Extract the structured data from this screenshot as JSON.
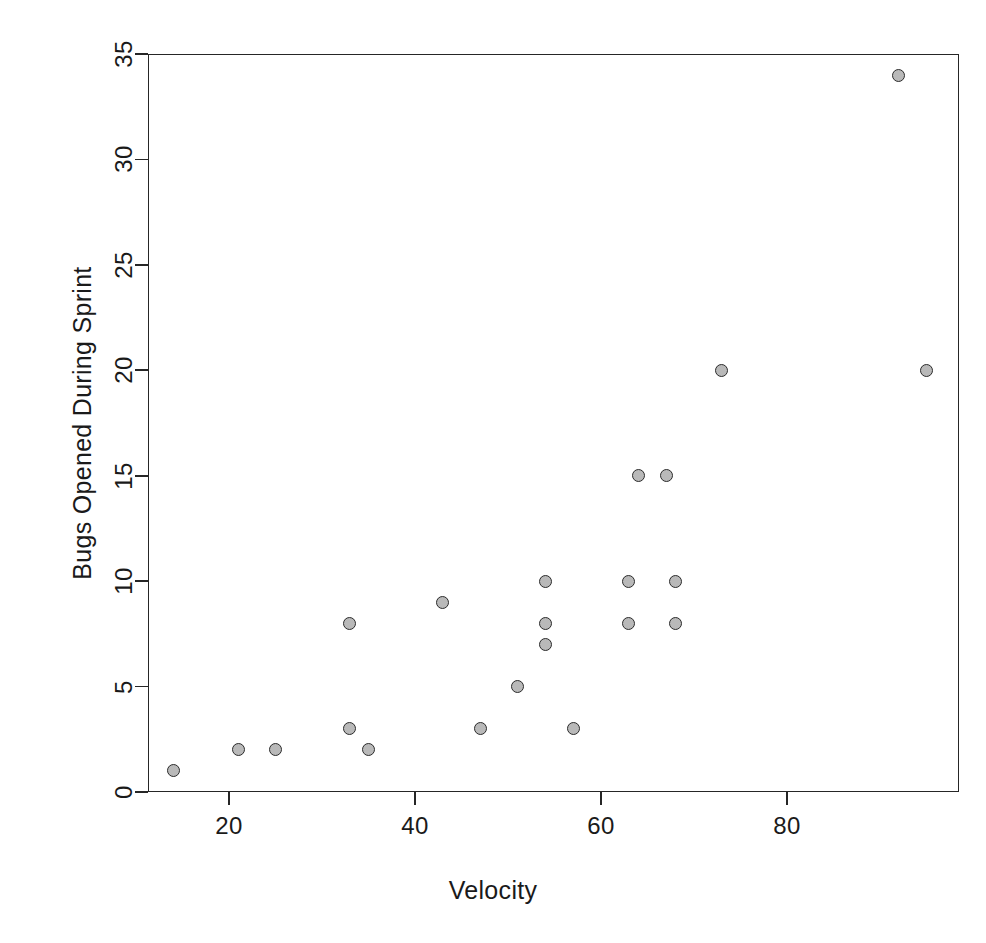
{
  "chart_data": {
    "type": "scatter",
    "title": "",
    "xlabel": "Velocity",
    "ylabel": "Bugs Opened During Sprint",
    "xlim": [
      12,
      99
    ],
    "ylim": [
      -0.6,
      35.6
    ],
    "xticks": [
      20,
      40,
      60,
      80
    ],
    "xtick_labels": [
      "20",
      "40",
      "60",
      "80"
    ],
    "yticks": [
      0,
      5,
      10,
      15,
      20,
      25,
      30,
      35
    ],
    "ytick_labels": [
      "0",
      "5",
      "10",
      "15",
      "20",
      "25",
      "30",
      "35"
    ],
    "grid": false,
    "legend": null,
    "marker": {
      "shape": "circle",
      "fill_color": "#b9b9b9",
      "edge_color": "#2b2b2b",
      "size_px": 13
    },
    "n_points": 22,
    "points": [
      {
        "x": 14,
        "y": 1
      },
      {
        "x": 21,
        "y": 2
      },
      {
        "x": 25,
        "y": 2
      },
      {
        "x": 33,
        "y": 8
      },
      {
        "x": 33,
        "y": 3
      },
      {
        "x": 35,
        "y": 2
      },
      {
        "x": 43,
        "y": 9
      },
      {
        "x": 47,
        "y": 3
      },
      {
        "x": 51,
        "y": 5
      },
      {
        "x": 54,
        "y": 10
      },
      {
        "x": 54,
        "y": 8
      },
      {
        "x": 54,
        "y": 7
      },
      {
        "x": 57,
        "y": 3
      },
      {
        "x": 63,
        "y": 10
      },
      {
        "x": 63,
        "y": 8
      },
      {
        "x": 64,
        "y": 15
      },
      {
        "x": 67,
        "y": 15
      },
      {
        "x": 68,
        "y": 10
      },
      {
        "x": 68,
        "y": 8
      },
      {
        "x": 73,
        "y": 20
      },
      {
        "x": 92,
        "y": 34
      },
      {
        "x": 95,
        "y": 20
      }
    ]
  },
  "axes": {
    "frame_color": "#262626",
    "background": "#ffffff"
  }
}
